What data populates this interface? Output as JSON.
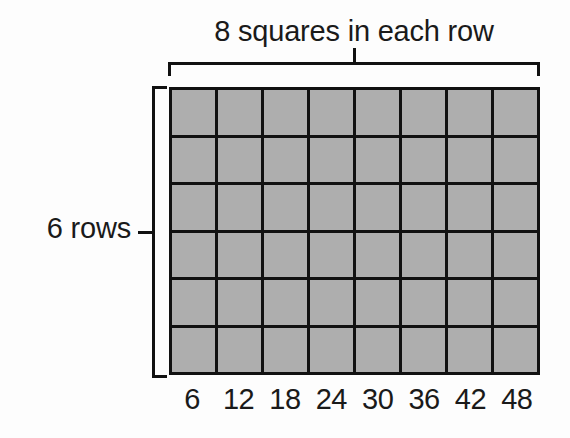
{
  "figure": {
    "top_label": "8 squares in each row",
    "left_label": "6 rows",
    "columns": 8,
    "rows": 6,
    "cell_fill_color": "#aeaeae",
    "line_color": "#111111",
    "background_color": "#fdfdfd"
  },
  "chart_data": {
    "type": "table",
    "title": "8 squares in each row",
    "xlabel": "",
    "ylabel": "6 rows",
    "categories": [
      "1",
      "2",
      "3",
      "4",
      "5",
      "6",
      "7",
      "8"
    ],
    "values": [
      6,
      12,
      18,
      24,
      30,
      36,
      42,
      48
    ],
    "tick_labels": [
      "6",
      "12",
      "18",
      "24",
      "30",
      "36",
      "42",
      "48"
    ],
    "rows": 6,
    "columns": 8,
    "total_squares": 48,
    "grid": true,
    "legend": "none"
  }
}
